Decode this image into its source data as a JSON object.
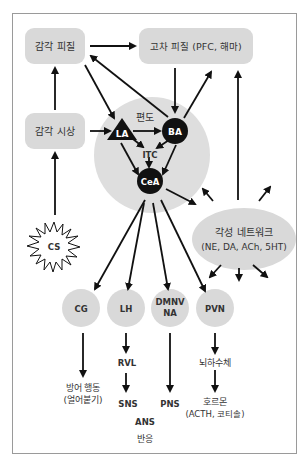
{
  "diagram": {
    "colors": {
      "node_fill": "#d9d9d9",
      "amygdala_fill": "#dedede",
      "black_node": "#111111",
      "text": "#333333",
      "frame_border": "#9a9a9a"
    },
    "boxes": {
      "sensory_cortex": "감각 피질",
      "higher_cortex": "고차 피질 (PFC, 해마)",
      "sensory_thalamus": "감각 시상"
    },
    "amygdala": {
      "label": "편도",
      "nuclei": {
        "la": "LA",
        "ba": "BA",
        "itc": "ITC",
        "cea": "CeA"
      }
    },
    "stimulus": "CS",
    "arousal_network": {
      "title": "각성 네트워크",
      "subtitle": "(NE, DA, ACh, 5HT)"
    },
    "outputs": {
      "cg": "CG",
      "lh": "LH",
      "dmnv_line1": "DMNV",
      "dmnv_line2": "NA",
      "pvn": "PVN"
    },
    "downstream": {
      "defense_line1": "방어 행동",
      "defense_line2": "(얼어붙기)",
      "rvl": "RVL",
      "sns": "SNS",
      "pns": "PNS",
      "ans": "ANS",
      "response": "반응",
      "pituitary": "뇌하수체",
      "hormone_line1": "호르몬",
      "hormone_line2": "(ACTH, 코티솔)"
    }
  }
}
